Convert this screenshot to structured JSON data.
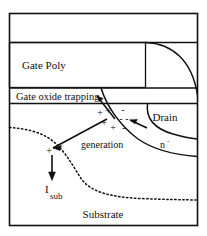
{
  "figure": {
    "type": "device-cross-section-diagram",
    "background_color": "#ffffff",
    "line_color": "#101010"
  },
  "regions": {
    "top_band_label": "",
    "gate_poly": "Gate Poly",
    "gate_oxide": "Gate oxide trapping",
    "drain": "Drain",
    "drain_extension": "n",
    "drain_extension_superscript": "-",
    "substrate": "Substrate"
  },
  "annotations": {
    "generation": "generation",
    "substrate_current_symbol": "I",
    "substrate_current_subscript": "sub"
  },
  "charges": {
    "positive_symbol": "+",
    "negative_symbol": "-",
    "positive_count": 4,
    "negative_count": 4,
    "isolated_positive_symbol": "+"
  },
  "icons": {
    "trapping_arrow": "arrow-up-left-icon",
    "electron_arrow": "arrow-up-left-icon",
    "hole_arrow": "arrow-down-left-icon",
    "substrate_current_arrow": "arrow-down-icon"
  },
  "colors": {
    "line": "#101010",
    "fill": "#ffffff",
    "dotted": "#101010"
  }
}
